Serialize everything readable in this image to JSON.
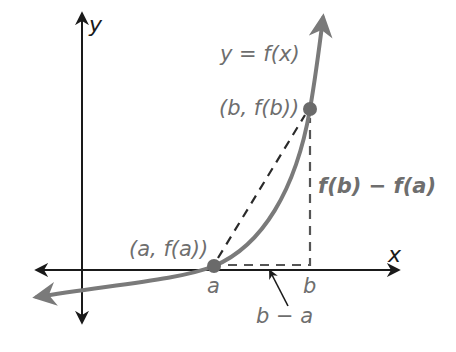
{
  "diagram": {
    "type": "secant-line-graph",
    "colors": {
      "axes": "#1a1a1a",
      "curve": "#7a7a7a",
      "points": "#6a6a6a",
      "dashed": "#2a2a2a",
      "label_text": "#6e6e6e"
    },
    "axes": {
      "x_label": "x",
      "y_label": "y"
    },
    "curve": {
      "label": "y = f(x)"
    },
    "points": [
      {
        "name": "a",
        "label": "(a, f(a))",
        "tick_label": "a"
      },
      {
        "name": "b",
        "label": "(b, f(b))",
        "tick_label": "b"
      }
    ],
    "annotations": {
      "vertical_change": "f(b) − f(a)",
      "horizontal_change": "b − a"
    }
  }
}
